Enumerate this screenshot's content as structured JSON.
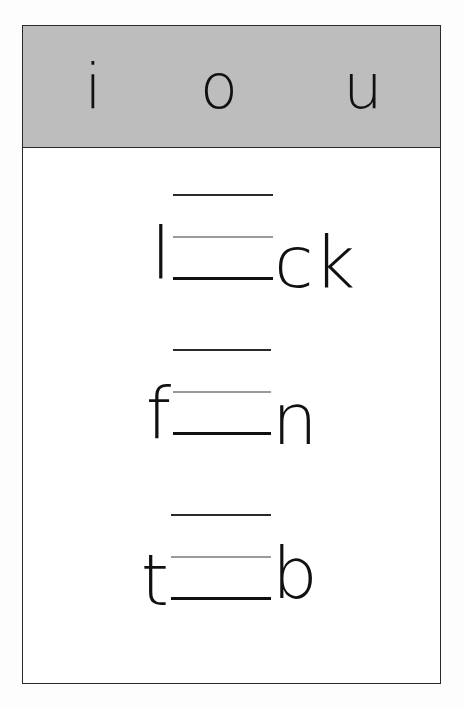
{
  "worksheet": {
    "background_color": "#fdfdfd",
    "frame_border_color": "#2a2a2a",
    "page_color": "#ffffff"
  },
  "header": {
    "background_color": "#bdbdbd",
    "vowels": [
      {
        "letter": "i"
      },
      {
        "letter": "o"
      },
      {
        "letter": "u"
      }
    ]
  },
  "exercises": {
    "rule_line_colors": {
      "top": "#2a2a2a",
      "middle": "#9a9a9a",
      "bottom": "#111111"
    },
    "rows": [
      {
        "prefix": "l",
        "suffix": "ck"
      },
      {
        "prefix": "f",
        "suffix": "n"
      },
      {
        "prefix": "t",
        "suffix": "b"
      }
    ]
  }
}
